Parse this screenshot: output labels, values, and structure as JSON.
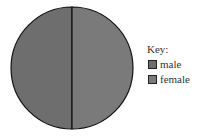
{
  "chart_data": {
    "type": "pie",
    "title": "",
    "legend_title": "Key:",
    "legend_position": "right",
    "slices": [
      {
        "label": "male",
        "value": 50,
        "color": "#6e6e6e"
      },
      {
        "label": "female",
        "value": 50,
        "color": "#7a7a7a"
      }
    ]
  }
}
